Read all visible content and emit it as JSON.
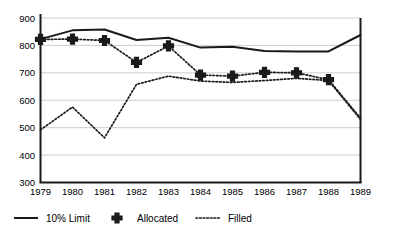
{
  "chart_data": {
    "type": "line",
    "title": "",
    "subtitle": "",
    "xlabel": "",
    "ylabel": "",
    "x": [
      1979,
      1980,
      1981,
      1982,
      1983,
      1984,
      1985,
      1986,
      1987,
      1988,
      1989
    ],
    "xtick_labels": [
      "1979",
      "1980",
      "1981",
      "1982",
      "1983",
      "1984",
      "1985",
      "1986",
      "1987",
      "1988",
      "1989"
    ],
    "ytick_labels": [
      "300",
      "400",
      "500",
      "600",
      "700",
      "800",
      "900"
    ],
    "ytick_values": [
      300,
      400,
      500,
      600,
      700,
      800,
      900
    ],
    "ylim": [
      300,
      900
    ],
    "xlim": [
      1979,
      1989
    ],
    "grid": true,
    "grid_axis": "y",
    "legend_position": "bottom",
    "series": [
      {
        "name": "10% Limit",
        "style": "solid",
        "marker": "none",
        "color": "#1a1a1a",
        "values": [
          823,
          855,
          858,
          820,
          828,
          792,
          795,
          780,
          778,
          778,
          838
        ]
      },
      {
        "name": "Allocated",
        "style": "dotted",
        "marker": "plus",
        "color": "#1a1a1a",
        "values": [
          822,
          823,
          818,
          738,
          798,
          692,
          688,
          702,
          700,
          675,
          535
        ]
      },
      {
        "name": "Filled",
        "style": "dotted",
        "marker": "none",
        "color": "#1a1a1a",
        "values": [
          492,
          575,
          463,
          658,
          688,
          670,
          665,
          672,
          680,
          672,
          530
        ]
      }
    ]
  },
  "legend": {
    "items": [
      {
        "label": "10% Limit",
        "swatch": "solid-line"
      },
      {
        "label": "Allocated",
        "swatch": "plus-marker"
      },
      {
        "label": "Filled",
        "swatch": "dotted-line"
      }
    ]
  }
}
